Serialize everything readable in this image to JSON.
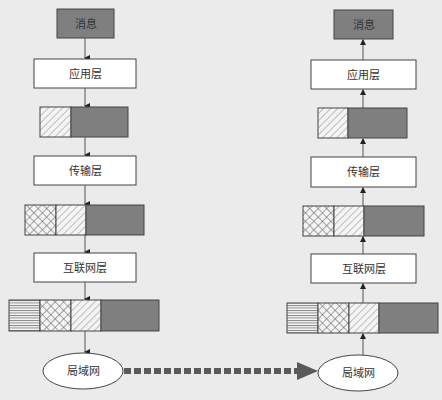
{
  "diagram": {
    "title": "",
    "colors": {
      "background": "#ebebeb",
      "payload": "#7f7f7f",
      "box_fill": "#ffffff",
      "stroke": "#444444",
      "dashed_arrow": "#5a5a5a"
    },
    "sender": {
      "message": "消息",
      "layers": [
        "应用层",
        "传输层",
        "互联网层"
      ],
      "network": "局域网",
      "flow_direction": "down"
    },
    "receiver": {
      "message": "消息",
      "layers": [
        "应用层",
        "传输层",
        "互联网层"
      ],
      "network": "局域网",
      "flow_direction": "up"
    },
    "packets": [
      {
        "after_layer": "应用层",
        "segments": [
          "diagonal-hatch",
          "payload"
        ]
      },
      {
        "after_layer": "传输层",
        "segments": [
          "cross-hatch",
          "diagonal-hatch",
          "payload"
        ]
      },
      {
        "after_layer": "互联网层",
        "segments": [
          "horizontal-lines",
          "cross-hatch",
          "diagonal-hatch",
          "payload"
        ]
      }
    ],
    "link": {
      "from": "局域网 (sender)",
      "to": "局域网 (receiver)",
      "style": "thick dashed arrow"
    }
  }
}
